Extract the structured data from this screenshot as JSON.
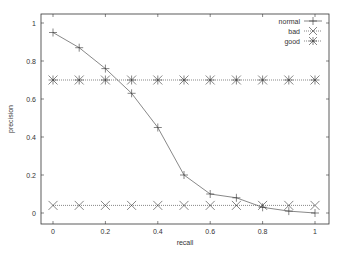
{
  "chart_data": {
    "type": "line",
    "title": "",
    "xlabel": "recall",
    "ylabel": "precision",
    "xlim": [
      -0.045,
      1.045
    ],
    "ylim": [
      -0.05,
      1.05
    ],
    "xticks": [
      0,
      0.2,
      0.4,
      0.6,
      0.8,
      1
    ],
    "xtick_labels": [
      "0",
      "0.2",
      "0.4",
      "0.6",
      "0.8",
      "1"
    ],
    "yticks": [
      0,
      0.2,
      0.4,
      0.6,
      0.8,
      1
    ],
    "ytick_labels": [
      "0",
      "0.2",
      "0.4",
      "0.6",
      "0.8",
      "1"
    ],
    "grid": false,
    "legend_position": "top-right",
    "x": [
      0,
      0.1,
      0.2,
      0.3,
      0.4,
      0.5,
      0.6,
      0.7,
      0.8,
      0.9,
      1.0
    ],
    "series": [
      {
        "name": "normal",
        "marker": "plus",
        "line": "solid",
        "values": [
          0.95,
          0.87,
          0.76,
          0.63,
          0.45,
          0.2,
          0.1,
          0.08,
          0.03,
          0.01,
          0.0
        ]
      },
      {
        "name": "bad",
        "marker": "cross",
        "line": "dotted",
        "values": [
          0.04,
          0.04,
          0.04,
          0.04,
          0.04,
          0.04,
          0.04,
          0.04,
          0.04,
          0.04,
          0.04
        ]
      },
      {
        "name": "good",
        "marker": "star",
        "line": "dotted",
        "values": [
          0.7,
          0.7,
          0.7,
          0.7,
          0.7,
          0.7,
          0.7,
          0.7,
          0.7,
          0.7,
          0.7
        ]
      }
    ]
  }
}
